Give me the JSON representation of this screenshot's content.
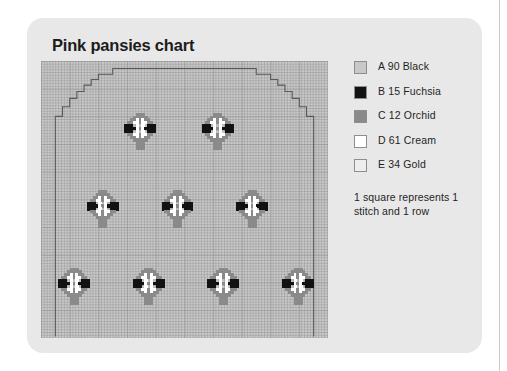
{
  "card": {
    "title": "Pink pansies chart"
  },
  "legend": {
    "items": [
      {
        "code": "A",
        "text": "A 90 Black",
        "color": "#c8c8c8",
        "swatch_name": "legend-swatch-a-90-black"
      },
      {
        "code": "B",
        "text": "B 15 Fuchsia",
        "color": "#121212",
        "swatch_name": "legend-swatch-b-15-fuchsia"
      },
      {
        "code": "C",
        "text": "C 12 Orchid",
        "color": "#8a8a8a",
        "swatch_name": "legend-swatch-c-12-orchid"
      },
      {
        "code": "D",
        "text": "D 61 Cream",
        "color": "#ffffff",
        "swatch_name": "legend-swatch-d-61-cream"
      },
      {
        "code": "E",
        "text": "E 34 Gold",
        "color": "#ededed",
        "swatch_name": "legend-swatch-e-34-gold"
      }
    ],
    "note": "1 square represents 1 stitch and 1 row"
  },
  "chart_data": {
    "type": "heatmap",
    "title": "Pink pansies chart",
    "xlabel": "stitches",
    "ylabel": "rows",
    "grid": true,
    "legend_position": "right",
    "background_color": "#c8c8c8",
    "outline_color": "#5a5a5a",
    "cell_size_px": 2.87,
    "grid_cells_x": 100,
    "grid_cells_y": 100,
    "palette": {
      "A": "#c8c8c8",
      "B": "#121212",
      "C": "#8a8a8a",
      "D": "#ffffff",
      "E": "#ededed"
    },
    "motif_name": "pansy",
    "motif_width_cells": 11,
    "motif_height_cells": 13,
    "motif_pattern": [
      "....CCC....",
      "...CCCCC...",
      "..CCDCDCC..",
      ".CCDDCDDCC.",
      "BBB.D.D.BBB",
      "BBBBDCDBBBB",
      "BBB.D.D.BBB",
      ".CCDDCDDCC.",
      "..CCDCDCC..",
      "...CCCCC...",
      "....CCC....",
      "....CCC....",
      "....CCC...."
    ],
    "motif_positions": [
      {
        "row": 1,
        "col": 1,
        "x_cell": 29,
        "y_cell": 18
      },
      {
        "row": 1,
        "col": 2,
        "x_cell": 56,
        "y_cell": 18
      },
      {
        "row": 2,
        "col": 1,
        "x_cell": 16,
        "y_cell": 45
      },
      {
        "row": 2,
        "col": 2,
        "x_cell": 42,
        "y_cell": 45
      },
      {
        "row": 2,
        "col": 3,
        "x_cell": 68,
        "y_cell": 45
      },
      {
        "row": 3,
        "col": 1,
        "x_cell": 6,
        "y_cell": 72
      },
      {
        "row": 3,
        "col": 2,
        "x_cell": 32,
        "y_cell": 72
      },
      {
        "row": 3,
        "col": 3,
        "x_cell": 58,
        "y_cell": 72
      },
      {
        "row": 3,
        "col": 4,
        "x_cell": 84,
        "y_cell": 72
      }
    ],
    "motif_count": 9,
    "outline_shape": "stepped dome / arch garment outline",
    "outline_points_pct": [
      [
        5.0,
        99.5
      ],
      [
        5.0,
        20.0
      ],
      [
        7.5,
        20.0
      ],
      [
        7.5,
        16.5
      ],
      [
        10.0,
        16.5
      ],
      [
        10.0,
        13.5
      ],
      [
        12.5,
        13.5
      ],
      [
        12.5,
        11.0
      ],
      [
        15.0,
        11.0
      ],
      [
        15.0,
        8.7
      ],
      [
        17.5,
        8.7
      ],
      [
        17.5,
        6.7
      ],
      [
        20.0,
        6.7
      ],
      [
        20.0,
        4.8
      ],
      [
        25.0,
        4.8
      ],
      [
        25.0,
        2.7
      ],
      [
        75.0,
        2.7
      ],
      [
        75.0,
        4.8
      ],
      [
        80.0,
        4.8
      ],
      [
        80.0,
        6.7
      ],
      [
        82.5,
        6.7
      ],
      [
        82.5,
        8.7
      ],
      [
        85.0,
        8.7
      ],
      [
        85.0,
        11.0
      ],
      [
        87.5,
        11.0
      ],
      [
        87.5,
        13.5
      ],
      [
        90.0,
        13.5
      ],
      [
        90.0,
        16.5
      ],
      [
        92.5,
        16.5
      ],
      [
        92.5,
        20.0
      ],
      [
        95.0,
        20.0
      ],
      [
        95.0,
        99.5
      ]
    ]
  }
}
